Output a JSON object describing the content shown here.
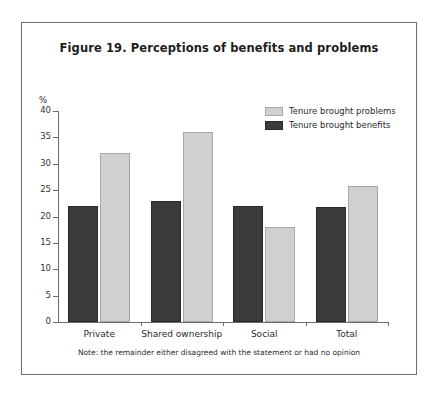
{
  "figure": {
    "title": "Figure 19. Perceptions of benefits and problems",
    "note": "Note: the remainder either disagreed with the statement or had no opinion"
  },
  "chart_data": {
    "type": "bar",
    "title": "Figure 19. Perceptions of benefits and problems",
    "subtitle": "",
    "xlabel": "",
    "ylabel": "%",
    "categories": [
      "Private",
      "Shared ownership",
      "Social",
      "Total"
    ],
    "series": [
      {
        "name": "Tenure brought problems",
        "color": "#d0d0d0",
        "values": [
          32,
          36,
          18,
          25.8
        ]
      },
      {
        "name": "Tenure brought benefits",
        "color": "#3b3b3b",
        "values": [
          22,
          23,
          22,
          21.8
        ]
      }
    ],
    "ylim": [
      0,
      40
    ],
    "yticks": [
      0,
      5,
      10,
      15,
      20,
      25,
      30,
      35,
      40
    ],
    "ytick_labels": [
      "0",
      "5",
      "10",
      "15",
      "20",
      "25",
      "30",
      "35",
      "40"
    ],
    "grid": false,
    "legend_position": "top-right",
    "legend_entries": [
      "Tenure brought problems",
      "Tenure brought benefits"
    ],
    "annotations": [
      "Note: the remainder either disagreed with the statement or had no opinion"
    ]
  }
}
